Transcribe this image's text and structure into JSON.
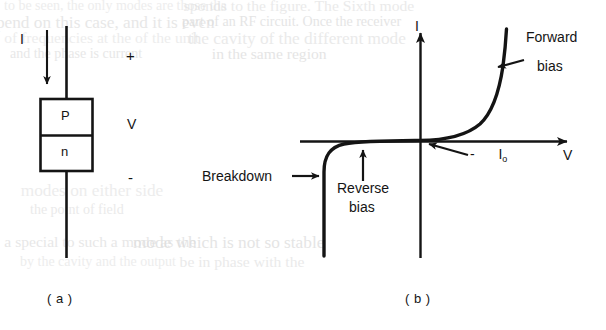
{
  "figure": {
    "title_panels": [
      "( a )",
      "( b )"
    ],
    "panel_a": {
      "caption": "( a )",
      "current_label": "I",
      "voltage_label": "V",
      "plus_sign": "+",
      "minus_sign": "-",
      "region_top": "P",
      "region_bottom": "n"
    },
    "panel_b": {
      "caption": "( b )",
      "y_axis_label": "I",
      "x_axis_label": "V",
      "annotations": {
        "forward_line1": "Forward",
        "forward_line2": "bias",
        "reverse_line1": "Reverse",
        "reverse_line2": "bias",
        "breakdown": "Breakdown",
        "saturation_minus": "-",
        "saturation_symbol": "I",
        "saturation_subscript": "o"
      }
    }
  },
  "chart_data": {
    "type": "line",
    "title": "",
    "xlabel": "V",
    "ylabel": "I",
    "grid": false,
    "legend": null,
    "axes": {
      "origin_px": [
        420,
        142
      ],
      "x_axis_from_px": [
        300,
        142
      ],
      "x_axis_to_px": [
        572,
        142
      ],
      "y_axis_from_px": [
        420,
        258
      ],
      "y_axis_to_px": [
        420,
        28
      ]
    },
    "series": [
      {
        "name": "Diode I-V characteristic",
        "description": "Ideal p-n junction diode current vs voltage: exponential rise in forward bias, small constant reverse saturation current -Io, and sharp reverse breakdown.",
        "points_px": [
          [
            324,
            255
          ],
          [
            324,
            180
          ],
          [
            325,
            162
          ],
          [
            329,
            152
          ],
          [
            337,
            146
          ],
          [
            352,
            143
          ],
          [
            375,
            142
          ],
          [
            400,
            141
          ],
          [
            420,
            141
          ],
          [
            440,
            140
          ],
          [
            458,
            137
          ],
          [
            472,
            131
          ],
          [
            483,
            120
          ],
          [
            491,
            104
          ],
          [
            497,
            84
          ],
          [
            501,
            62
          ],
          [
            504,
            42
          ],
          [
            506,
            30
          ]
        ]
      }
    ],
    "annotations": [
      {
        "text": "Forward bias",
        "target_px": [
          495,
          72
        ],
        "label_px": [
          528,
          40
        ]
      },
      {
        "text": "Reverse bias",
        "target_px": [
          363,
          148
        ],
        "label_px": [
          340,
          180
        ]
      },
      {
        "text": "Breakdown",
        "target_px": [
          324,
          177
        ],
        "label_px": [
          203,
          170
        ]
      },
      {
        "text": "- Io",
        "target_px": [
          428,
          143
        ],
        "label_px": [
          470,
          150
        ]
      }
    ]
  },
  "ghost_text": {
    "note": "faint bleed-through text from the reverse side of the scanned page",
    "lines": [
      {
        "text": "to be seen, the only  modes are those tha",
        "x": 4,
        "y": -2
      },
      {
        "text": "sponds to the figure.  The Sixth mode",
        "x": 188,
        "y": -2
      },
      {
        "text": "pend on this case, and  it is even",
        "x": 4,
        "y": 14
      },
      {
        "text": "part of an RF circuit. Once the receiver",
        "x": 182,
        "y": 14
      },
      {
        "text": "of frequencies at the  of the unit",
        "x": 8,
        "y": 30
      },
      {
        "text": "the cavity of the  different mode",
        "x": 196,
        "y": 30
      },
      {
        "text": "and the phase is  current",
        "x": 10,
        "y": 46
      },
      {
        "text": "in the same  region",
        "x": 214,
        "y": 46
      },
      {
        "text": "modes on either side",
        "x": 26,
        "y": 182
      },
      {
        "text": "the point of  field",
        "x": 30,
        "y": 202
      },
      {
        "text": "a special  to such  a  mode  as the",
        "x": 8,
        "y": 234
      },
      {
        "text": "mode  which  is  not  so  stable",
        "x": 140,
        "y": 234
      },
      {
        "text": "by  the  cavity  and  the  output",
        "x": 20,
        "y": 254
      },
      {
        "text": "be  in  phase  with  the",
        "x": 182,
        "y": 254
      }
    ]
  }
}
